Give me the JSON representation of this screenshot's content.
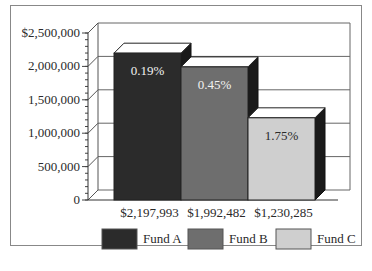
{
  "chart_data": {
    "type": "bar",
    "title": "",
    "xlabel": "",
    "ylabel": "",
    "ylim": [
      0,
      2500000
    ],
    "yticks": [
      "0",
      "500,000",
      "1,000,000",
      "1,500,000",
      "2,000,000",
      "$2,500,000"
    ],
    "ytick_values": [
      0,
      500000,
      1000000,
      1500000,
      2000000,
      2500000
    ],
    "categories": [
      "$2,197,993",
      "$1,992,482",
      "$1,230,285"
    ],
    "values": [
      2197993,
      1992482,
      1230285
    ],
    "bar_labels": [
      "0.19%",
      "0.45%",
      "1.75%"
    ],
    "series_names": [
      "Fund A",
      "Fund B",
      "Fund C"
    ],
    "colors": [
      "#2b2b2b",
      "#6e6e6e",
      "#cfcfcf"
    ],
    "grid": true,
    "style": "3d",
    "legend_position": "bottom"
  },
  "legend": {
    "items": [
      {
        "label": "Fund A",
        "color": "#2b2b2b"
      },
      {
        "label": "Fund B",
        "color": "#6e6e6e"
      },
      {
        "label": "Fund C",
        "color": "#cfcfcf"
      }
    ]
  }
}
